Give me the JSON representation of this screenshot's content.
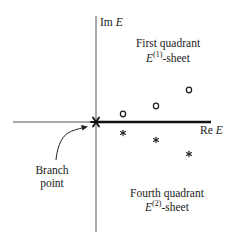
{
  "diagram": {
    "axes": {
      "imag_label": "Im",
      "imag_var": "E",
      "real_label": "Re",
      "real_var": "E"
    },
    "regions": {
      "first": {
        "title": "First quadrant",
        "sheet_var": "E",
        "sheet_sup": "(1)",
        "sheet_suffix": "-sheet"
      },
      "fourth": {
        "title": "Fourth quadrant",
        "sheet_var": "E",
        "sheet_sup": "(2)",
        "sheet_suffix": "-sheet"
      }
    },
    "branch": {
      "line1": "Branch",
      "line2": "point"
    },
    "markers": {
      "circles": [
        [
          123,
          114
        ],
        [
          156,
          106
        ],
        [
          189,
          90
        ]
      ],
      "asterisks": [
        [
          123,
          133
        ],
        [
          156,
          140
        ],
        [
          189,
          154
        ]
      ],
      "circle_symbol": "o",
      "asterisk_symbol": "*"
    },
    "colors": {
      "ink": "#1a1a1a",
      "axis": "#444444",
      "background": "#ffffff"
    }
  }
}
